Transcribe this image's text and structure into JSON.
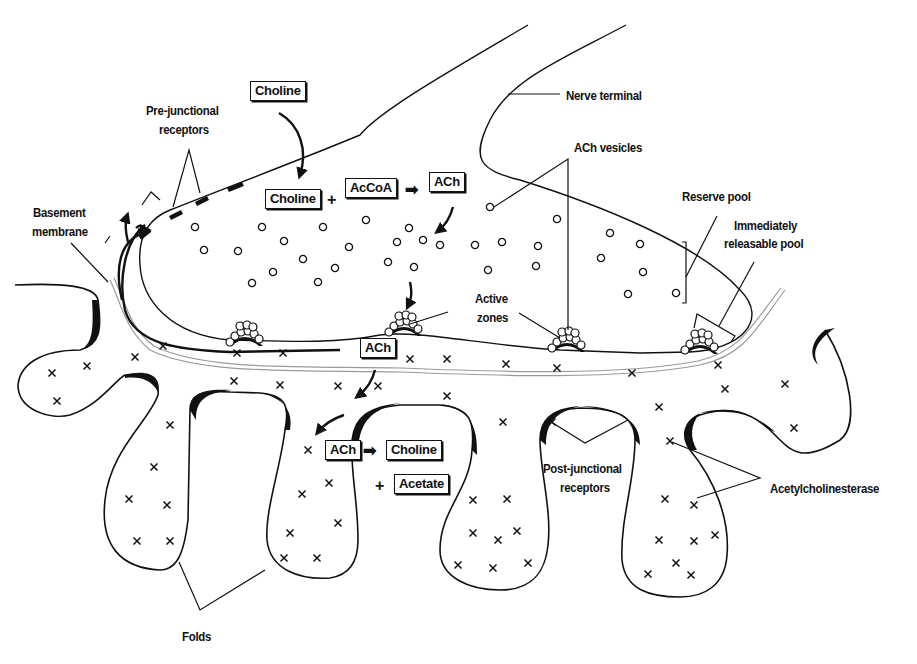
{
  "diagram": {
    "labels": {
      "nerve_terminal": "Nerve terminal",
      "ach_vesicles": "ACh vesicles",
      "reserve_pool": "Reserve pool",
      "immediately_releasable_pool_line1": "Immediately",
      "immediately_releasable_pool_line2": "releasable pool",
      "pre_junctional_line1": "Pre-junctional",
      "pre_junctional_line2": "receptors",
      "basement_line1": "Basement",
      "basement_line2": "membrane",
      "active_zones_line1": "Active",
      "active_zones_line2": "zones",
      "post_junctional_line1": "Post-junctional",
      "post_junctional_line2": "receptors",
      "acetylcholinesterase": "Acetylcholinesterase",
      "folds": "Folds"
    },
    "synthesis": {
      "choline_uptake": "Choline",
      "choline": "Choline",
      "plus": "+",
      "accoa": "AcCoA",
      "arrow": "➡",
      "ach": "ACh"
    },
    "cleft": {
      "released_ach": "ACh"
    },
    "hydrolysis": {
      "ach": "ACh",
      "arrow": "➡",
      "choline": "Choline",
      "plus": "+",
      "acetate": "Acetate"
    },
    "colors": {
      "ink": "#111111",
      "background": "#ffffff",
      "membrane": "#9a9a9a"
    }
  }
}
